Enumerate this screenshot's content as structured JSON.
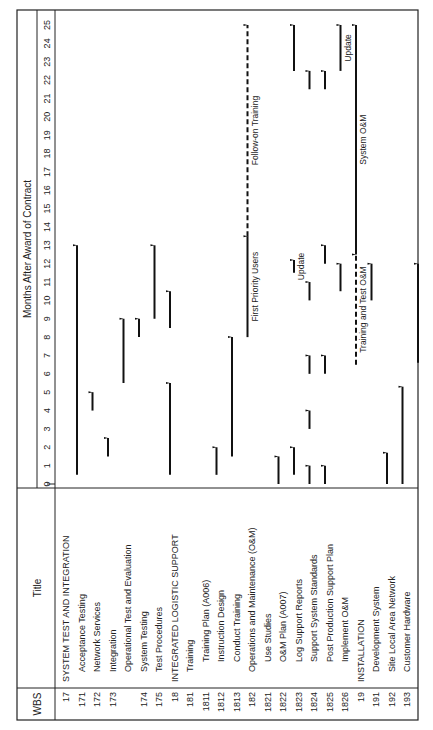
{
  "chart_data": {
    "type": "gantt",
    "title": "",
    "header": {
      "wbs": "WBS",
      "title": "Title",
      "axis_label": "Months After Award of Contract"
    },
    "x_axis": {
      "min": 0,
      "max": 25,
      "ticks": [
        0,
        1,
        2,
        3,
        4,
        5,
        6,
        7,
        8,
        9,
        10,
        11,
        12,
        13,
        14,
        15,
        16,
        17,
        18,
        19,
        20,
        21,
        22,
        23,
        24,
        25
      ]
    },
    "rows": [
      {
        "wbs": "17",
        "title": "SYSTEM TEST AND INTEGRATION",
        "level": 0,
        "bars": [
          {
            "start": 0.5,
            "end": 13
          }
        ]
      },
      {
        "wbs": "171",
        "title": "Acceptance Testing",
        "level": 1,
        "bars": [
          {
            "start": 4,
            "end": 5
          }
        ]
      },
      {
        "wbs": "172",
        "title": "Network Services",
        "level": 1,
        "bars": [
          {
            "start": 1.5,
            "end": 2.5
          }
        ]
      },
      {
        "wbs": "173",
        "title": "Integration",
        "level": 1,
        "bars": [
          {
            "start": 5.5,
            "end": 9
          }
        ]
      },
      {
        "wbs": "",
        "title": "Operational Test and Evaluation",
        "level": 1,
        "bars": [
          {
            "start": 8,
            "end": 9
          }
        ]
      },
      {
        "wbs": "174",
        "title": "System Testing",
        "level": 1,
        "bars": [
          {
            "start": 9,
            "end": 13
          }
        ]
      },
      {
        "wbs": "175",
        "title": "Test Procedures",
        "level": 1,
        "bars": [
          {
            "start": 0.5,
            "end": 5.5
          },
          {
            "start": 8.5,
            "end": 10.5
          }
        ]
      },
      {
        "wbs": "18",
        "title": "INTEGRATED LOGISTIC SUPPORT",
        "level": 0,
        "bars": []
      },
      {
        "wbs": "181",
        "title": "Training",
        "level": 1,
        "bars": []
      },
      {
        "wbs": "1811",
        "title": "Training Plan (A006)",
        "level": 2,
        "bars": [
          {
            "start": 0.5,
            "end": 2
          }
        ]
      },
      {
        "wbs": "1812",
        "title": "Instruction Design",
        "level": 2,
        "bars": [
          {
            "start": 1.5,
            "end": 8
          }
        ]
      },
      {
        "wbs": "1813",
        "title": "Conduct Training",
        "level": 2,
        "bars": [
          {
            "start": 8,
            "end": 13.5,
            "label": "First Priority Users"
          },
          {
            "start": 13.5,
            "end": 25,
            "style": "dashed",
            "label": "Follow-on Training"
          }
        ]
      },
      {
        "wbs": "182",
        "title": "Operations and Maintenance (O&M)",
        "level": 1,
        "bars": []
      },
      {
        "wbs": "1821",
        "title": "Use Studies",
        "level": 2,
        "bars": [
          {
            "start": 0,
            "end": 1.5
          }
        ]
      },
      {
        "wbs": "1822",
        "title": "O&M Plan (A007)",
        "level": 2,
        "bars": [
          {
            "start": 0.5,
            "end": 2
          },
          {
            "start": 11.5,
            "end": 12.2,
            "label": "Update"
          },
          {
            "start": 22.5,
            "end": 25
          }
        ]
      },
      {
        "wbs": "1823",
        "title": "Log Support Reports",
        "level": 2,
        "bars": [
          {
            "start": 0,
            "end": 1
          },
          {
            "start": 3,
            "end": 4
          },
          {
            "start": 6,
            "end": 7
          },
          {
            "start": 10,
            "end": 11
          },
          {
            "start": 21.5,
            "end": 22.5
          }
        ]
      },
      {
        "wbs": "1824",
        "title": "Support System Standards",
        "level": 2,
        "bars": [
          {
            "start": 0,
            "end": 1
          },
          {
            "start": 6,
            "end": 7
          },
          {
            "start": 12,
            "end": 13
          },
          {
            "start": 21.5,
            "end": 22.5
          }
        ]
      },
      {
        "wbs": "1825",
        "title": "Post Production Support Plan",
        "level": 2,
        "bars": [
          {
            "start": 10.5,
            "end": 12
          },
          {
            "start": 22.5,
            "end": 25,
            "label": "Update"
          }
        ]
      },
      {
        "wbs": "1826",
        "title": "Implement O&M",
        "level": 2,
        "bars": [
          {
            "start": 6.5,
            "end": 12.5,
            "style": "dashed",
            "label": "Training and Test O&M"
          },
          {
            "start": 12.5,
            "end": 25,
            "label": "System O&M"
          }
        ]
      },
      {
        "wbs": "19",
        "title": "INSTALLATION",
        "level": 0,
        "bars": [
          {
            "start": 10,
            "end": 12
          }
        ]
      },
      {
        "wbs": "191",
        "title": "Development System",
        "level": 1,
        "bars": [
          {
            "start": 0,
            "end": 1.7
          }
        ]
      },
      {
        "wbs": "192",
        "title": "Site Local Area Network",
        "level": 1,
        "bars": [
          {
            "start": 0,
            "end": 5.3
          }
        ]
      },
      {
        "wbs": "193",
        "title": "Customer Hardware",
        "level": 1,
        "bars": [
          {
            "start": 6.6,
            "end": 12
          }
        ]
      }
    ]
  }
}
